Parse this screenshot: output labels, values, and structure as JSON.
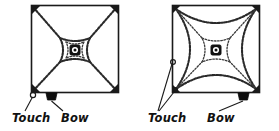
{
  "figure": {
    "background_color": "#ffffff",
    "ink_color": "#111111",
    "width": 279,
    "height": 131
  },
  "panels": [
    {
      "id": "left",
      "name": "square-plate-left",
      "description": "Square plate bowed at the middle of the bottom edge and touched at the lower-left corner, producing a four-pointed star (astroid) nodal figure with nodal lines running to the four corners.",
      "plate": {
        "x": 31,
        "y": 5,
        "size": 88,
        "shape": "square"
      },
      "center_marker": {
        "x": 75,
        "y": 50,
        "label": "clamped-center"
      },
      "touch_points": [
        {
          "x": 33,
          "y": 95,
          "position": "lower-left-corner"
        }
      ],
      "bow_point": {
        "x": 51,
        "y": 99,
        "position": "bottom-edge"
      },
      "nodal_pattern": "astroid-with-diagonals",
      "labels": {
        "touch": "Touch",
        "bow": "Bow"
      }
    },
    {
      "id": "right",
      "name": "square-plate-right",
      "description": "Square plate bowed at the middle of the bottom edge and touched at two points on the left side, producing a four-pointed star nodal figure enclosed by four outer arcs.",
      "plate": {
        "x": 33,
        "y": 5,
        "size": 88,
        "shape": "square"
      },
      "center_marker": {
        "x": 77,
        "y": 50,
        "label": "clamped-center"
      },
      "touch_points": [
        {
          "x": 34,
          "y": 62,
          "position": "mid-left-edge"
        },
        {
          "x": 36,
          "y": 94,
          "position": "lower-left-corner"
        }
      ],
      "bow_point": {
        "x": 104,
        "y": 99,
        "position": "bottom-edge"
      },
      "nodal_pattern": "astroid-with-diagonals-and-outer-arcs",
      "labels": {
        "touch": "Touch",
        "bow": "Bow"
      }
    }
  ],
  "labels": {
    "left_touch": "Touch",
    "left_bow": "Bow",
    "right_touch": "Touch",
    "right_bow": "Bow"
  }
}
